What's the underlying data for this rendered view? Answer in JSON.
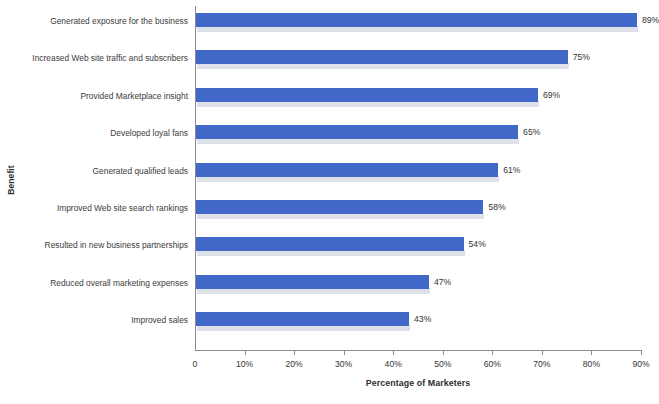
{
  "chart_data": {
    "type": "bar",
    "orientation": "horizontal",
    "title": "",
    "xlabel": "Percentage of Marketers",
    "ylabel": "Benefit",
    "xlim": [
      0,
      90
    ],
    "grid": false,
    "legend": null,
    "bar_color": "#4168c6",
    "shadow_color": "#dfe1ea",
    "axis_color": "#8c8c8c",
    "xticks": [
      0,
      10,
      20,
      30,
      40,
      50,
      60,
      70,
      80,
      90
    ],
    "xtick_labels": [
      "0",
      "10%",
      "20%",
      "30%",
      "40%",
      "50%",
      "60%",
      "70%",
      "80%",
      "90%"
    ],
    "categories": [
      "Generated exposure for the business",
      "Increased Web site traffic and subscribers",
      "Provided Marketplace insight",
      "Developed loyal fans",
      "Generated qualified leads",
      "Improved Web site search rankings",
      "Resulted in new business partnerships",
      "Reduced overall marketing expenses",
      "Improved sales"
    ],
    "values": [
      89,
      75,
      69,
      65,
      61,
      58,
      54,
      47,
      43
    ],
    "value_labels": [
      "89%",
      "75%",
      "69%",
      "65%",
      "61%",
      "58%",
      "54%",
      "47%",
      "43%"
    ]
  }
}
